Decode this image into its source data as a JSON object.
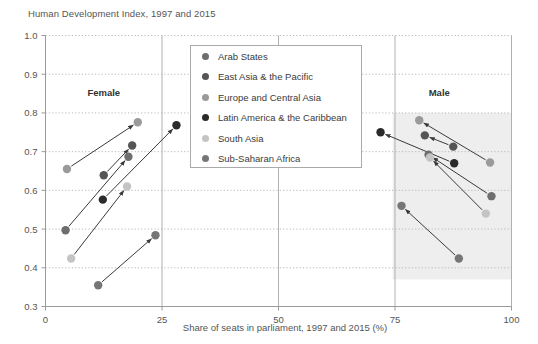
{
  "chart_data": {
    "type": "scatter",
    "title": "Human Development Index, 1997 and 2015",
    "xlabel": "Share of seats in parliament, 1997 and 2015 (%)",
    "ylabel": "Human Development Index",
    "xlim": [
      0,
      100
    ],
    "ylim": [
      0.3,
      1.0
    ],
    "xticks": [
      "0",
      "25",
      "50",
      "75",
      "100"
    ],
    "xtickvals": [
      0,
      25,
      50,
      75,
      100
    ],
    "yticks": [
      "0.3",
      "0.4",
      "0.5",
      "0.6",
      "0.7",
      "0.8",
      "0.9",
      "1.0"
    ],
    "ytickvals": [
      0.3,
      0.4,
      0.5,
      0.6,
      0.7,
      0.8,
      0.9,
      1.0
    ],
    "grid": true,
    "legend_position": "top-center",
    "annotations": [
      {
        "text": "Female",
        "x": 12.5,
        "y": 0.845
      },
      {
        "text": "Male",
        "x": 84.5,
        "y": 0.845
      }
    ],
    "shaded_band": {
      "x_start": 74.5,
      "x_end": 100,
      "y_start": 0.37,
      "y_end": 0.8,
      "color": "#eeeeee"
    },
    "series": [
      {
        "name": "Arab States",
        "color": "#6e6e6e",
        "points": [
          {
            "group": "Female",
            "year": 1997,
            "x": 4.3,
            "y": 0.497
          },
          {
            "group": "Female",
            "year": 2015,
            "x": 17.8,
            "y": 0.687
          },
          {
            "group": "Male",
            "year": 1997,
            "x": 95.7,
            "y": 0.585
          },
          {
            "group": "Male",
            "year": 2015,
            "x": 82.2,
            "y": 0.692
          }
        ]
      },
      {
        "name": "East Asia & the Pacific",
        "color": "#555555",
        "points": [
          {
            "group": "Female",
            "year": 1997,
            "x": 12.5,
            "y": 0.639
          },
          {
            "group": "Female",
            "year": 2015,
            "x": 18.6,
            "y": 0.716
          },
          {
            "group": "Male",
            "year": 1997,
            "x": 87.5,
            "y": 0.713
          },
          {
            "group": "Male",
            "year": 2015,
            "x": 81.4,
            "y": 0.742
          }
        ]
      },
      {
        "name": "Europe and Central Asia",
        "color": "#9a9a9a",
        "points": [
          {
            "group": "Female",
            "year": 1997,
            "x": 4.6,
            "y": 0.655
          },
          {
            "group": "Female",
            "year": 2015,
            "x": 19.8,
            "y": 0.776
          },
          {
            "group": "Male",
            "year": 1997,
            "x": 95.4,
            "y": 0.672
          },
          {
            "group": "Male",
            "year": 2015,
            "x": 80.2,
            "y": 0.781
          }
        ]
      },
      {
        "name": "Latin America & the Caribbean",
        "color": "#2b2b2b",
        "points": [
          {
            "group": "Female",
            "year": 1997,
            "x": 12.3,
            "y": 0.576
          },
          {
            "group": "Female",
            "year": 2015,
            "x": 28.1,
            "y": 0.768
          },
          {
            "group": "Male",
            "year": 1997,
            "x": 87.7,
            "y": 0.67
          },
          {
            "group": "Male",
            "year": 2015,
            "x": 71.9,
            "y": 0.75
          }
        ]
      },
      {
        "name": "South Asia",
        "color": "#c4c4c4",
        "points": [
          {
            "group": "Female",
            "year": 1997,
            "x": 5.5,
            "y": 0.424
          },
          {
            "group": "Female",
            "year": 2015,
            "x": 17.5,
            "y": 0.61
          },
          {
            "group": "Male",
            "year": 1997,
            "x": 94.5,
            "y": 0.54
          },
          {
            "group": "Male",
            "year": 2015,
            "x": 82.5,
            "y": 0.685
          }
        ]
      },
      {
        "name": "Sub-Saharan Africa",
        "color": "#767676",
        "points": [
          {
            "group": "Female",
            "year": 1997,
            "x": 11.3,
            "y": 0.355
          },
          {
            "group": "Female",
            "year": 2015,
            "x": 23.6,
            "y": 0.484
          },
          {
            "group": "Male",
            "year": 1997,
            "x": 88.7,
            "y": 0.424
          },
          {
            "group": "Male",
            "year": 2015,
            "x": 76.4,
            "y": 0.56
          }
        ]
      }
    ]
  },
  "legend": {
    "items": [
      {
        "label": "Arab States",
        "color": "#6e6e6e"
      },
      {
        "label": "East Asia & the Pacific",
        "color": "#555555"
      },
      {
        "label": "Europe and Central Asia",
        "color": "#9a9a9a"
      },
      {
        "label": "Latin America & the Caribbean",
        "color": "#2b2b2b"
      },
      {
        "label": "South Asia",
        "color": "#c4c4c4"
      },
      {
        "label": "Sub-Saharan Africa",
        "color": "#767676"
      }
    ]
  }
}
